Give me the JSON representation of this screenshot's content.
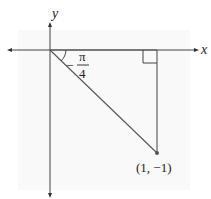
{
  "diagram": {
    "axes": {
      "x_label": "x",
      "y_label": "y"
    },
    "angle": {
      "sign": "−",
      "numerator": "π",
      "denominator": "4",
      "label": "−π/4"
    },
    "point": {
      "label": "(1, −1)",
      "x": 1,
      "y": -1
    },
    "right_angle_marker": true,
    "colors": {
      "lines": "#444444",
      "background_panel": "#f9f9f9",
      "text": "#222222"
    }
  }
}
